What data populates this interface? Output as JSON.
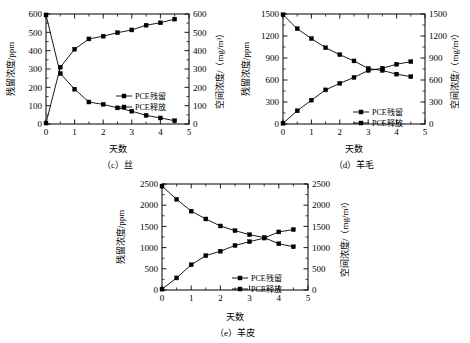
{
  "figure": {
    "panel_count": 3,
    "background": "#ffffff",
    "line_color": "#000000",
    "marker_color": "#000000"
  },
  "common": {
    "xlabel": "天数",
    "ylabel_left": "残留浓度/ppm",
    "ylabel_right": "空间浓度/（mg/m³）",
    "legend": [
      "PCE残留",
      "PCE释放"
    ],
    "xticks": [
      "0",
      "1",
      "2",
      "3",
      "4",
      "5"
    ]
  },
  "chart_data": [
    {
      "id": "c",
      "type": "line",
      "title": "（c）丝",
      "caption": "（c）丝",
      "xlabel": "天数",
      "ylabel": "残留浓度/ppm",
      "ylabel_right": "空间浓度/（mg/m³）",
      "xlim": [
        0,
        5
      ],
      "ylim": [
        0,
        600
      ],
      "ylim_right": [
        0,
        600
      ],
      "xticks": [
        "0",
        "1",
        "2",
        "3",
        "4",
        "5"
      ],
      "yticks": [
        "0",
        "100",
        "200",
        "300",
        "400",
        "500",
        "600"
      ],
      "yticks_right": [
        "0",
        "100",
        "200",
        "300",
        "400",
        "500",
        "600"
      ],
      "grid": false,
      "legend_position": "center-right",
      "x": [
        0,
        0.5,
        1,
        1.5,
        2,
        2.5,
        3,
        3.5,
        4,
        4.5
      ],
      "series": [
        {
          "name": "PCE残留",
          "values": [
            595,
            275,
            190,
            120,
            107,
            88,
            70,
            47,
            33,
            18
          ]
        },
        {
          "name": "PCE释放",
          "values": [
            5,
            310,
            408,
            464,
            479,
            498,
            513,
            539,
            552,
            572
          ]
        }
      ]
    },
    {
      "id": "d",
      "type": "line",
      "title": "（d）羊毛",
      "caption": "（d）羊毛",
      "xlabel": "天数",
      "ylabel": "残留浓度/ppm",
      "ylabel_right": "空间浓度/（mg/m³）",
      "xlim": [
        0,
        5
      ],
      "ylim": [
        0,
        1500
      ],
      "ylim_right": [
        0,
        1500
      ],
      "xticks": [
        "0",
        "1",
        "2",
        "3",
        "4",
        "5"
      ],
      "yticks": [
        "0",
        "300",
        "600",
        "900",
        "1200",
        "1500"
      ],
      "yticks_right": [
        "0",
        "300",
        "600",
        "900",
        "1200",
        "1500"
      ],
      "grid": false,
      "legend_position": "bottom-right",
      "x": [
        0,
        0.5,
        1,
        1.5,
        2,
        2.5,
        3,
        3.5,
        4,
        4.5
      ],
      "series": [
        {
          "name": "PCE残留",
          "values": [
            1490,
            1300,
            1165,
            1040,
            945,
            860,
            757,
            730,
            680,
            645
          ]
        },
        {
          "name": "PCE释放",
          "values": [
            10,
            180,
            325,
            465,
            555,
            635,
            730,
            760,
            815,
            850
          ]
        }
      ]
    },
    {
      "id": "e",
      "type": "line",
      "title": "（e）羊皮",
      "caption": "（e）羊皮",
      "xlabel": "天数",
      "ylabel": "残留浓度/ppm",
      "ylabel_right": "空间浓度/（mg/m³）",
      "xlim": [
        0,
        5
      ],
      "ylim": [
        0,
        2500
      ],
      "ylim_right": [
        0,
        2500
      ],
      "xticks": [
        "0",
        "1",
        "2",
        "3",
        "4",
        "5"
      ],
      "yticks": [
        "0",
        "500",
        "1000",
        "1500",
        "2000",
        "2500"
      ],
      "yticks_right": [
        "0",
        "500",
        "1000",
        "1500",
        "2000",
        "2500"
      ],
      "grid": false,
      "legend_position": "bottom-right",
      "x": [
        0,
        0.5,
        1,
        1.5,
        2,
        2.5,
        3,
        3.5,
        4,
        4.5
      ],
      "series": [
        {
          "name": "PCE残留",
          "values": [
            2450,
            2140,
            1860,
            1675,
            1510,
            1400,
            1305,
            1235,
            1090,
            1020
          ]
        },
        {
          "name": "PCE释放",
          "values": [
            20,
            285,
            595,
            810,
            915,
            1050,
            1140,
            1225,
            1370,
            1425
          ]
        }
      ]
    }
  ]
}
